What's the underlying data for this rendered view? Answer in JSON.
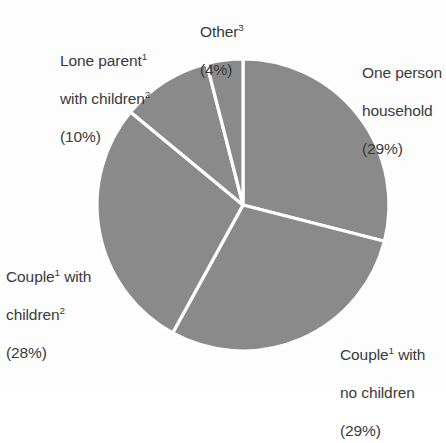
{
  "figure": {
    "background_color": "#fdfdfd",
    "text_color": "#3a3a3a"
  },
  "chart_data": {
    "type": "pie",
    "title": "",
    "subtitle": "",
    "xlabel": "",
    "ylabel": "",
    "legend_position": "none",
    "grid": false,
    "labels_position": "outside",
    "start_angle_deg": 0,
    "direction": "clockwise",
    "slice_fill_color": "#8a8a8a",
    "slice_separator_color": "#ffffff",
    "categories": [
      "One person household",
      "Couple with no children",
      "Couple with children",
      "Lone parent with children",
      "Other"
    ],
    "values": [
      29,
      29,
      28,
      10,
      4
    ],
    "units": "%",
    "slices": [
      {
        "name": "one-person-household",
        "label_lines": [
          "One person",
          "household"
        ],
        "value_text": "(29%)",
        "value": 29,
        "superscript": ""
      },
      {
        "name": "couple-no-children",
        "label_lines": [
          "Couple",
          " with",
          "no children"
        ],
        "value_text": "(29%)",
        "value": 29,
        "superscript": "1"
      },
      {
        "name": "couple-with-children",
        "label_lines": [
          "Couple",
          " with",
          "children"
        ],
        "value_text": "(28%)",
        "value": 28,
        "superscript": "1"
      },
      {
        "name": "lone-parent-with-children",
        "label_lines": [
          "Lone parent",
          "with children"
        ],
        "value_text": "(10%)",
        "value": 10,
        "superscript": "1"
      },
      {
        "name": "other",
        "label_lines": [
          "Other"
        ],
        "value_text": "(4%)",
        "value": 4,
        "superscript": "3"
      }
    ]
  },
  "labels": {
    "other": {
      "line1_text": "Other",
      "line1_sup": "3",
      "line2_text": "(4%)"
    },
    "lone_parent": {
      "line1_text": "Lone parent",
      "line1_sup": "1",
      "line2_text": "with children",
      "line2_sup": "2",
      "line3_text": "(10%)"
    },
    "one_person": {
      "line1_text": "One person",
      "line2_text": "household",
      "line3_text": "(29%)"
    },
    "couple_children": {
      "line1_text": "Couple",
      "line1_sup": "1",
      "line1_tail": " with",
      "line2_text": "children",
      "line2_sup": "2",
      "line3_text": "(28%)"
    },
    "couple_no_children": {
      "line1_text": "Couple",
      "line1_sup": "1",
      "line1_tail": " with",
      "line2_text": "no children",
      "line3_text": "(29%)"
    }
  }
}
